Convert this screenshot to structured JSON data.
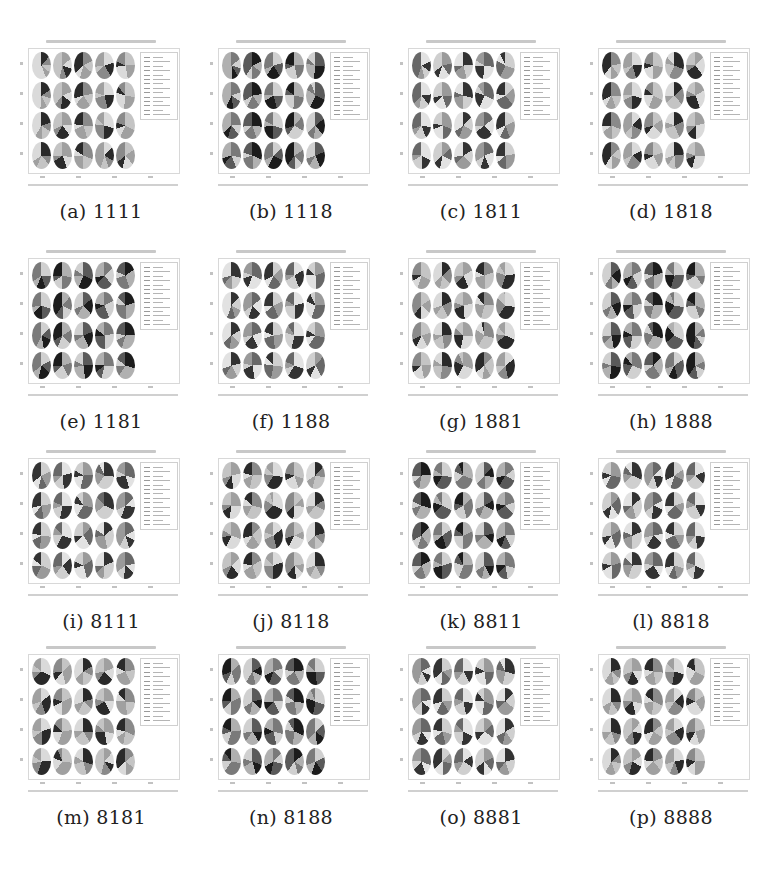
{
  "figure": {
    "layout": {
      "rows": 4,
      "cols": 4
    },
    "panel_content": "4x5 grid of pie charts with legend (embedded text illegible)",
    "subfigures": [
      {
        "label": "(a)",
        "id": "1111"
      },
      {
        "label": "(b)",
        "id": "1118"
      },
      {
        "label": "(c)",
        "id": "1811"
      },
      {
        "label": "(d)",
        "id": "1818"
      },
      {
        "label": "(e)",
        "id": "1181"
      },
      {
        "label": "(f)",
        "id": "1188"
      },
      {
        "label": "(g)",
        "id": "1881"
      },
      {
        "label": "(h)",
        "id": "1888"
      },
      {
        "label": "(i)",
        "id": "8111"
      },
      {
        "label": "(j)",
        "id": "8118"
      },
      {
        "label": "(k)",
        "id": "8811"
      },
      {
        "label": "(l)",
        "id": "8818"
      },
      {
        "label": "(m)",
        "id": "8181"
      },
      {
        "label": "(n)",
        "id": "8188"
      },
      {
        "label": "(o)",
        "id": "8881"
      },
      {
        "label": "(p)",
        "id": "8888"
      }
    ]
  },
  "captions": [
    "(a) 1111",
    "(b) 1118",
    "(c) 1811",
    "(d) 1818",
    "(e) 1181",
    "(f) 1188",
    "(g) 1881",
    "(h) 1888",
    "(i) 8111",
    "(j) 8118",
    "(k) 8811",
    "(l) 8818",
    "(m) 8181",
    "(n) 8188",
    "(o) 8881",
    "(p) 8888"
  ],
  "colors": {
    "dark": "#1e1e1e",
    "mid": "#6e6e6e",
    "light": "#bdbdbd",
    "pale": "#dedede"
  }
}
